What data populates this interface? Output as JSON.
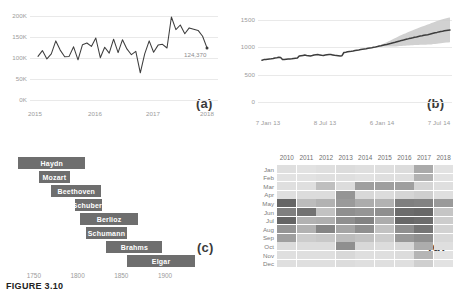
{
  "caption": "FIGURE 3.10",
  "panels": {
    "a": {
      "label": "(a)"
    },
    "b": {
      "label": "(b)"
    },
    "c": {
      "label": "(c)"
    },
    "d": {
      "label": "(d)"
    }
  },
  "chart_data": [
    {
      "id": "a",
      "type": "line",
      "title": "",
      "xlabel": "",
      "ylabel": "",
      "grid": true,
      "legend": "none",
      "ylim": [
        0,
        210000
      ],
      "ytick_labels": [
        "200K",
        "150K",
        "100K",
        "50K",
        "0K"
      ],
      "ytick_values": [
        200000,
        150000,
        100000,
        50000,
        0
      ],
      "xtick_labels": [
        "2015",
        "2016",
        "2017",
        "2018"
      ],
      "annotation": {
        "text": "124,370",
        "value": 124370
      },
      "line_color": "#3d3d3d",
      "x": [
        0,
        1,
        2,
        3,
        4,
        5,
        6,
        7,
        8,
        9,
        10,
        11,
        12,
        13,
        14,
        15,
        16,
        17,
        18,
        19,
        20,
        21,
        22,
        23,
        24,
        25,
        26,
        27,
        28,
        29,
        30,
        31,
        32,
        33,
        34,
        35,
        36,
        37,
        38,
        39,
        40,
        41,
        42,
        43
      ],
      "values": [
        104000,
        118000,
        98000,
        110000,
        141000,
        119000,
        103000,
        104000,
        127000,
        96000,
        132000,
        136000,
        128000,
        148000,
        101000,
        126000,
        112000,
        145000,
        113000,
        144000,
        122000,
        108000,
        116000,
        65000,
        110000,
        141000,
        114000,
        131000,
        133000,
        124000,
        198000,
        168000,
        179000,
        158000,
        172000,
        169000,
        166000,
        152000,
        124370
      ]
    },
    {
      "id": "b",
      "type": "line",
      "title": "",
      "xlabel": "",
      "ylabel": "",
      "grid": true,
      "legend": "none",
      "ylim": [
        0,
        1600
      ],
      "ytick_labels": [
        "1500",
        "1000",
        "500",
        "0"
      ],
      "ytick_values": [
        1500,
        1000,
        500,
        0
      ],
      "xtick_labels": [
        "7 Jan 13",
        "8 Jul 13",
        "6 Jan 14",
        "7 Jul 14"
      ],
      "line_color": "#3d3d3d",
      "band_color": "#c9c9c9",
      "band_label": "uncertainty band",
      "values": [
        760,
        770,
        772,
        778,
        782,
        786,
        790,
        800,
        806,
        812,
        808,
        770,
        772,
        776,
        780,
        784,
        786,
        790,
        794,
        798,
        836,
        842,
        848,
        852,
        846,
        842,
        838,
        846,
        854,
        858,
        862,
        856,
        850,
        846,
        852,
        860,
        866,
        862,
        856,
        850,
        846,
        842,
        838,
        842,
        900,
        906,
        912,
        918,
        922,
        928,
        934,
        940,
        946,
        952,
        958,
        964,
        970,
        976,
        982,
        988,
        994,
        1000,
        1008,
        1016,
        1024,
        1032,
        1040,
        1048,
        1056,
        1064,
        1072,
        1080,
        1090,
        1100,
        1110,
        1120,
        1128,
        1136,
        1144,
        1152,
        1160,
        1168,
        1176,
        1184,
        1192,
        1200,
        1206,
        1212,
        1218,
        1224,
        1230,
        1240,
        1250,
        1258,
        1266,
        1274,
        1282,
        1288,
        1294,
        1300,
        1306,
        1310
      ],
      "band_upper": [
        760,
        770,
        772,
        778,
        782,
        786,
        790,
        800,
        806,
        812,
        808,
        770,
        772,
        776,
        780,
        784,
        786,
        790,
        794,
        798,
        836,
        842,
        848,
        852,
        846,
        842,
        838,
        846,
        854,
        858,
        862,
        856,
        850,
        846,
        852,
        860,
        866,
        862,
        856,
        850,
        846,
        842,
        838,
        842,
        900,
        906,
        912,
        918,
        922,
        928,
        934,
        940,
        946,
        952,
        958,
        964,
        970,
        976,
        982,
        988,
        994,
        1002,
        1014,
        1026,
        1040,
        1056,
        1072,
        1088,
        1104,
        1120,
        1136,
        1152,
        1170,
        1188,
        1204,
        1220,
        1234,
        1248,
        1262,
        1276,
        1290,
        1304,
        1318,
        1332,
        1346,
        1360,
        1372,
        1384,
        1396,
        1408,
        1420,
        1434,
        1448,
        1460,
        1472,
        1484,
        1496,
        1506,
        1514,
        1522,
        1530,
        1536
      ],
      "band_lower": [
        760,
        770,
        772,
        778,
        782,
        786,
        790,
        800,
        806,
        812,
        808,
        770,
        772,
        776,
        780,
        784,
        786,
        790,
        794,
        798,
        836,
        842,
        848,
        852,
        846,
        842,
        838,
        846,
        854,
        858,
        862,
        856,
        850,
        846,
        852,
        860,
        866,
        862,
        856,
        850,
        846,
        842,
        838,
        842,
        900,
        906,
        912,
        918,
        922,
        928,
        934,
        940,
        946,
        952,
        958,
        964,
        970,
        976,
        982,
        988,
        994,
        998,
        1002,
        1006,
        1008,
        1008,
        1008,
        1008,
        1008,
        1008,
        1008,
        1008,
        1010,
        1012,
        1016,
        1020,
        1022,
        1024,
        1026,
        1028,
        1030,
        1032,
        1034,
        1036,
        1038,
        1040,
        1040,
        1040,
        1042,
        1044,
        1046,
        1048,
        1052,
        1056,
        1060,
        1064,
        1068,
        1072,
        1076,
        1080,
        1084,
        1088
      ]
    },
    {
      "id": "c",
      "type": "bar",
      "orientation": "horizontal",
      "subtype": "gantt",
      "title": "",
      "xlabel": "",
      "ylabel": "",
      "grid": false,
      "legend": "none",
      "xlim": [
        1725,
        1940
      ],
      "xtick_labels": [
        "1750",
        "1800",
        "1850",
        "1900"
      ],
      "xtick_values": [
        1750,
        1800,
        1850,
        1900
      ],
      "bar_color": "#6e6e6e",
      "bar_text_color": "#ffffff",
      "categories": [
        "Haydn",
        "Mozart",
        "Beethoven",
        "Schubert",
        "Berlioz",
        "Schumann",
        "Brahms",
        "Elgar"
      ],
      "spans": [
        {
          "name": "Haydn",
          "start": 1732,
          "end": 1809
        },
        {
          "name": "Mozart",
          "start": 1756,
          "end": 1791
        },
        {
          "name": "Beethoven",
          "start": 1770,
          "end": 1827
        },
        {
          "name": "Schubert",
          "start": 1797,
          "end": 1828
        },
        {
          "name": "Berlioz",
          "start": 1803,
          "end": 1869
        },
        {
          "name": "Schumann",
          "start": 1810,
          "end": 1856
        },
        {
          "name": "Brahms",
          "start": 1833,
          "end": 1897
        },
        {
          "name": "Elgar",
          "start": 1857,
          "end": 1934
        }
      ]
    },
    {
      "id": "d",
      "type": "heatmap",
      "title": "",
      "xlabel": "",
      "ylabel": "",
      "grid": false,
      "legend": "none",
      "columns": [
        "2010",
        "2011",
        "2012",
        "2013",
        "2014",
        "2015",
        "2016",
        "2017",
        "2018"
      ],
      "rows": [
        "Jan",
        "Feb",
        "Mar",
        "Apr",
        "May",
        "Jun",
        "Jul",
        "Aug",
        "Sep",
        "Oct",
        "Nov",
        "Dec"
      ],
      "colormap": "greys",
      "vmin": 0,
      "vmax": 100,
      "values": [
        [
          12,
          10,
          12,
          14,
          12,
          12,
          14,
          45,
          10
        ],
        [
          10,
          10,
          12,
          12,
          10,
          12,
          12,
          40,
          10
        ],
        [
          12,
          12,
          32,
          14,
          52,
          52,
          52,
          18,
          12
        ],
        [
          12,
          14,
          14,
          58,
          16,
          14,
          18,
          22,
          12
        ],
        [
          88,
          34,
          40,
          55,
          44,
          40,
          72,
          70,
          55
        ],
        [
          72,
          80,
          30,
          62,
          58,
          62,
          84,
          86,
          28
        ],
        [
          88,
          40,
          42,
          62,
          70,
          44,
          86,
          84,
          24
        ],
        [
          58,
          40,
          68,
          48,
          62,
          30,
          62,
          78,
          20
        ],
        [
          52,
          24,
          26,
          34,
          30,
          24,
          56,
          62,
          16
        ],
        [
          14,
          14,
          14,
          62,
          16,
          14,
          16,
          44,
          12
        ],
        [
          12,
          12,
          12,
          16,
          12,
          12,
          14,
          38,
          10
        ],
        [
          12,
          12,
          12,
          14,
          12,
          12,
          12,
          22,
          10
        ]
      ]
    }
  ]
}
